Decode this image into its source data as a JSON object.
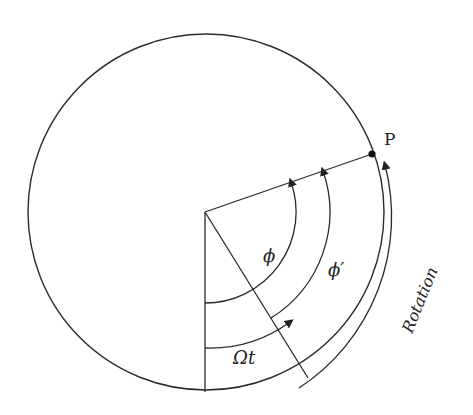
{
  "diagram": {
    "labels": {
      "point": "P",
      "phi": "ϕ",
      "phi_prime": "ϕ′",
      "omega_t": "Ωt",
      "rotation": "Rotation"
    },
    "colors": {
      "stroke": "#2a2a2a",
      "background": "#ffffff"
    }
  }
}
